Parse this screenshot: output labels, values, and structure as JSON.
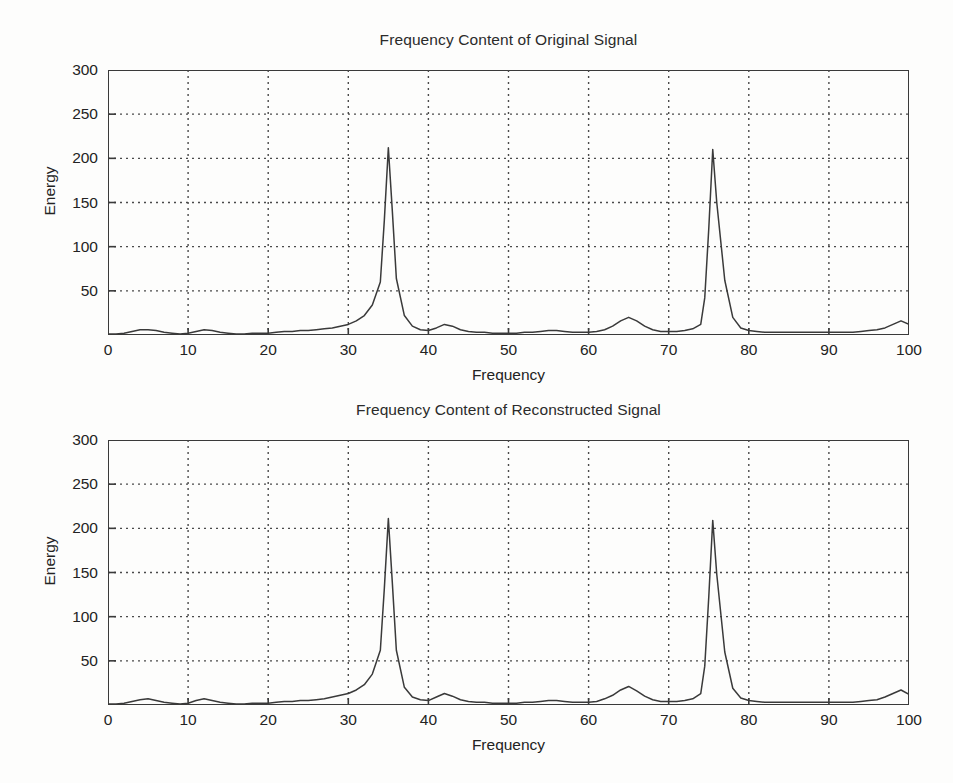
{
  "figure": {
    "background_color": "#fdfdfc",
    "line_color": "#3a3a3a",
    "grid_color": "#4a4a4a"
  },
  "charts": [
    {
      "id": "chart-original",
      "title": "Frequency Content of Original Signal",
      "xlabel": "Frequency",
      "ylabel": "Energy",
      "xticks": [
        "0",
        "10",
        "20",
        "30",
        "40",
        "50",
        "60",
        "70",
        "80",
        "90",
        "100"
      ],
      "yticks": [
        "300",
        "250",
        "200",
        "150",
        "100",
        "50"
      ]
    },
    {
      "id": "chart-reconstructed",
      "title": "Frequency Content of Reconstructed Signal",
      "xlabel": "Frequency",
      "ylabel": "Energy",
      "xticks": [
        "0",
        "10",
        "20",
        "30",
        "40",
        "50",
        "60",
        "70",
        "80",
        "90",
        "100"
      ],
      "yticks": [
        "300",
        "250",
        "200",
        "150",
        "100",
        "50"
      ]
    }
  ],
  "chart_data": [
    {
      "type": "line",
      "title": "Frequency Content of Original Signal",
      "xlabel": "Frequency",
      "ylabel": "Energy",
      "xlim": [
        0,
        100
      ],
      "ylim": [
        0,
        300
      ],
      "xticks": [
        0,
        10,
        20,
        30,
        40,
        50,
        60,
        70,
        80,
        90,
        100
      ],
      "yticks": [
        0,
        50,
        100,
        150,
        200,
        250,
        300
      ],
      "grid": true,
      "legend": "none",
      "series": [
        {
          "name": "Original signal spectrum",
          "x": [
            0,
            1,
            2,
            3,
            4,
            5,
            6,
            7,
            8,
            9,
            10,
            11,
            12,
            13,
            14,
            15,
            16,
            17,
            18,
            19,
            20,
            21,
            22,
            23,
            24,
            25,
            26,
            27,
            28,
            29,
            30,
            31,
            32,
            33,
            34,
            34.5,
            35,
            35.5,
            36,
            37,
            38,
            39,
            40,
            41,
            42,
            43,
            44,
            45,
            46,
            47,
            48,
            49,
            50,
            51,
            52,
            53,
            54,
            55,
            56,
            57,
            58,
            59,
            60,
            61,
            62,
            63,
            64,
            65,
            66,
            67,
            68,
            69,
            70,
            71,
            72,
            73,
            74,
            74.5,
            75,
            75.5,
            76,
            77,
            78,
            79,
            80,
            81,
            82,
            83,
            84,
            85,
            86,
            87,
            88,
            89,
            90,
            91,
            92,
            93,
            94,
            95,
            96,
            97,
            98,
            99,
            100
          ],
          "y": [
            1,
            1,
            2,
            4,
            6,
            6,
            5,
            3,
            2,
            1,
            2,
            4,
            6,
            5,
            3,
            2,
            1,
            1,
            2,
            2,
            2,
            3,
            4,
            4,
            5,
            5,
            6,
            7,
            8,
            10,
            12,
            16,
            22,
            34,
            60,
            130,
            212,
            140,
            64,
            22,
            10,
            6,
            5,
            8,
            12,
            10,
            6,
            4,
            3,
            3,
            2,
            2,
            2,
            2,
            3,
            3,
            4,
            5,
            5,
            4,
            3,
            3,
            3,
            4,
            6,
            10,
            16,
            20,
            16,
            10,
            6,
            4,
            4,
            4,
            5,
            7,
            12,
            42,
            120,
            210,
            150,
            62,
            20,
            8,
            5,
            4,
            3,
            3,
            3,
            3,
            3,
            3,
            3,
            3,
            3,
            3,
            3,
            3,
            4,
            5,
            6,
            8,
            12,
            16,
            12,
            6,
            2
          ]
        }
      ]
    },
    {
      "type": "line",
      "title": "Frequency Content of Reconstructed Signal",
      "xlabel": "Frequency",
      "ylabel": "Energy",
      "xlim": [
        0,
        100
      ],
      "ylim": [
        0,
        300
      ],
      "xticks": [
        0,
        10,
        20,
        30,
        40,
        50,
        60,
        70,
        80,
        90,
        100
      ],
      "yticks": [
        0,
        50,
        100,
        150,
        200,
        250,
        300
      ],
      "grid": true,
      "legend": "none",
      "series": [
        {
          "name": "Reconstructed signal spectrum",
          "x": [
            0,
            1,
            2,
            3,
            4,
            5,
            6,
            7,
            8,
            9,
            10,
            11,
            12,
            13,
            14,
            15,
            16,
            17,
            18,
            19,
            20,
            21,
            22,
            23,
            24,
            25,
            26,
            27,
            28,
            29,
            30,
            31,
            32,
            33,
            34,
            34.5,
            35,
            35.5,
            36,
            37,
            38,
            39,
            40,
            41,
            42,
            43,
            44,
            45,
            46,
            47,
            48,
            49,
            50,
            51,
            52,
            53,
            54,
            55,
            56,
            57,
            58,
            59,
            60,
            61,
            62,
            63,
            64,
            65,
            66,
            67,
            68,
            69,
            70,
            71,
            72,
            73,
            74,
            74.5,
            75,
            75.5,
            76,
            77,
            78,
            79,
            80,
            81,
            82,
            83,
            84,
            85,
            86,
            87,
            88,
            89,
            90,
            91,
            92,
            93,
            94,
            95,
            96,
            97,
            98,
            99,
            100
          ],
          "y": [
            1,
            1,
            2,
            4,
            6,
            7,
            5,
            3,
            2,
            1,
            2,
            5,
            7,
            5,
            3,
            2,
            1,
            1,
            2,
            2,
            2,
            3,
            4,
            4,
            5,
            5,
            6,
            7,
            9,
            11,
            13,
            17,
            23,
            35,
            62,
            132,
            211,
            138,
            62,
            20,
            9,
            6,
            5,
            9,
            13,
            10,
            6,
            4,
            3,
            3,
            2,
            2,
            2,
            2,
            3,
            3,
            4,
            5,
            5,
            4,
            3,
            3,
            3,
            4,
            7,
            11,
            17,
            21,
            16,
            10,
            6,
            4,
            4,
            4,
            5,
            7,
            13,
            44,
            122,
            209,
            148,
            60,
            19,
            8,
            5,
            4,
            3,
            3,
            3,
            3,
            3,
            3,
            3,
            3,
            3,
            3,
            3,
            3,
            4,
            5,
            6,
            9,
            13,
            17,
            12,
            6,
            2
          ]
        }
      ]
    }
  ]
}
